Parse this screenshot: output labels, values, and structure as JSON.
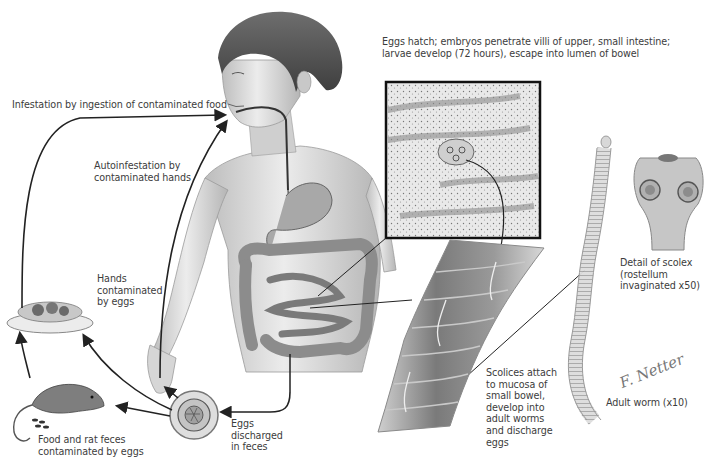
{
  "figure": {
    "palette": {
      "background": "#ffffff",
      "text": "#3c3c3c",
      "arrow": "#222222",
      "skin": "#d8d8d8",
      "organ": "#9c9c9c",
      "inset_border": "#111111"
    }
  },
  "labels": {
    "eggs_hatch": "Eggs hatch; embryos penetrate villi of upper, small intestine;\nlarvae develop (72 hours), escape into lumen of bowel",
    "ingestion": "Infestation by ingestion of contaminated food",
    "autoinfestation": "Autoinfestation by\ncontaminated hands",
    "hands_contaminated": "Hands\ncontaminated\nby eggs",
    "food_rat": "Food and rat feces\ncontaminated by eggs",
    "eggs_discharged": "Eggs\ndischarged\nin feces",
    "scolices_attach": "Scolices attach\nto mucosa of\nsmall bowel,\ndevelop into\nadult worms\nand discharge\neggs",
    "scolex_detail": "Detail of scolex\n(rostellum\ninvaginated x50)",
    "adult_worm": "Adult worm (x10)",
    "signature": "F. Netter"
  },
  "elements": {
    "child": "child-torso-with-digestive-tract",
    "inset": "intestinal-villi-inset",
    "bowel": "small-bowel-section",
    "worm": "adult-tapeworm",
    "scolex": "scolex-detail",
    "egg": "tapeworm-egg",
    "plate": "food-plate",
    "rat": "rat"
  }
}
